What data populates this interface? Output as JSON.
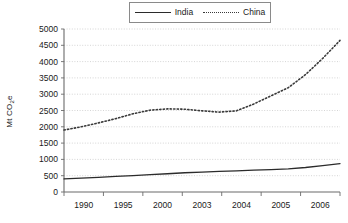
{
  "chart_data": {
    "type": "line",
    "title": "",
    "xlabel": "",
    "ylabel": "Mt CO",
    "ylabel_sub": "2",
    "ylabel_suffix": "e",
    "ylim": [
      0,
      5000
    ],
    "ytick_values": [
      0,
      500,
      1000,
      1500,
      2000,
      2500,
      3000,
      3500,
      4000,
      4500,
      5000
    ],
    "ytick_labels": [
      "0",
      "500",
      "1000",
      "1500",
      "2000",
      "2500",
      "3000",
      "3500",
      "4000",
      "4500",
      "5000"
    ],
    "xtick_labels": [
      "1990",
      "1995",
      "2000",
      "2003",
      "2004",
      "2005",
      "2006"
    ],
    "x": [
      1990,
      1991,
      1992,
      1993,
      1994,
      1995,
      1996,
      1997,
      1998,
      1999,
      2000,
      2001,
      2002,
      2003,
      2004,
      2005,
      2006
    ],
    "grid": true,
    "legend_position": "top",
    "series": [
      {
        "name": "India",
        "style": "solid",
        "color": "#2b2b2b",
        "values": [
          400,
          425,
          450,
          478,
          505,
          530,
          560,
          590,
          612,
          632,
          650,
          668,
          688,
          710,
          752,
          810,
          870
        ]
      },
      {
        "name": "China",
        "style": "dotted",
        "color": "#3a3a3a",
        "values": [
          1900,
          2000,
          2120,
          2250,
          2400,
          2510,
          2550,
          2540,
          2490,
          2450,
          2490,
          2700,
          2950,
          3200,
          3600,
          4100,
          4650
        ]
      }
    ]
  },
  "legend": {
    "entries": [
      {
        "label": "India",
        "key": "solid-line-key"
      },
      {
        "label": "China",
        "key": "dotted-line-key"
      }
    ]
  },
  "axes": {
    "y_title_text": "Mt CO",
    "y_title_sub": "2",
    "y_title_tail": "e"
  }
}
